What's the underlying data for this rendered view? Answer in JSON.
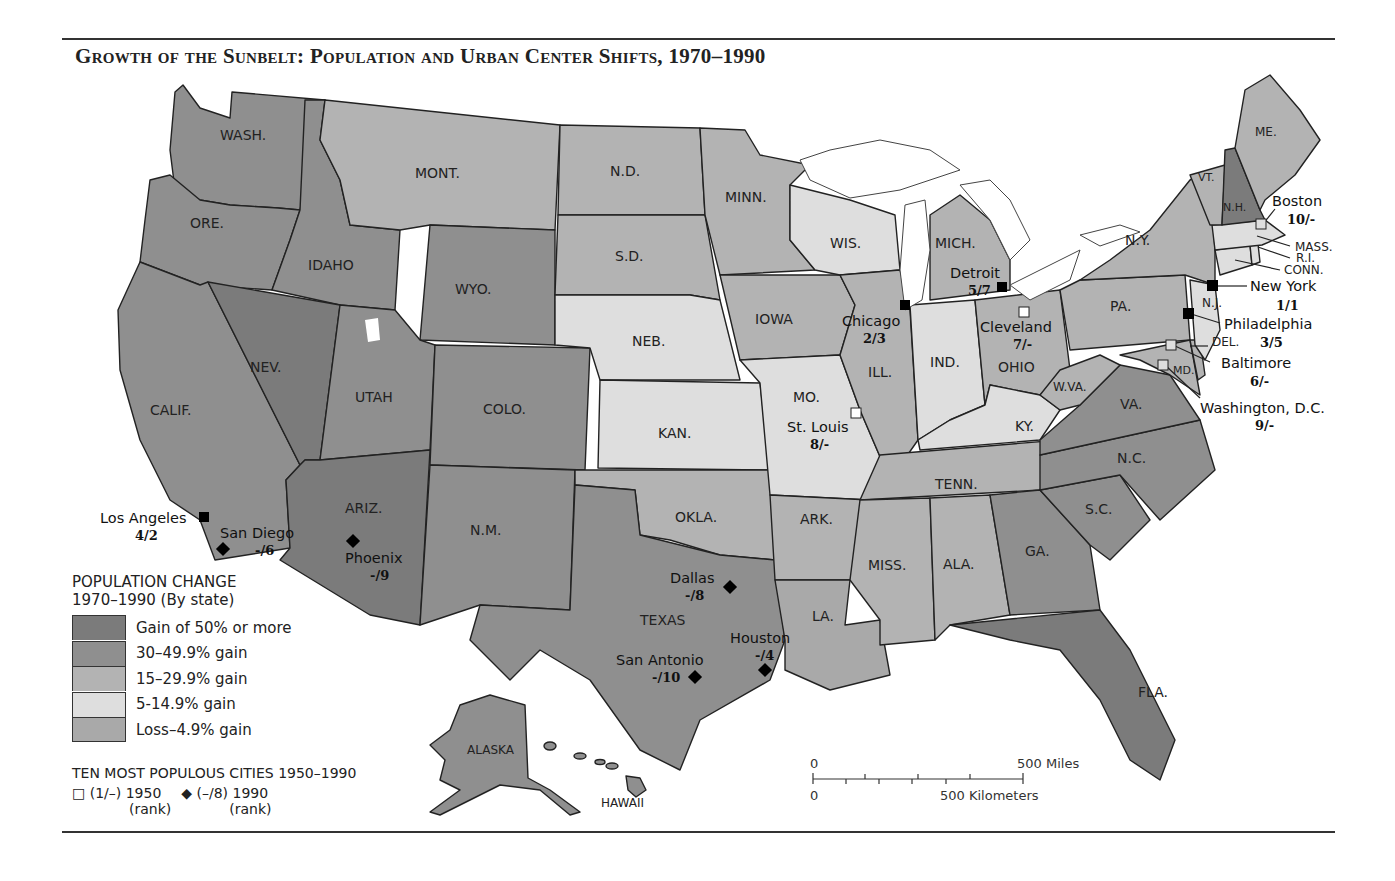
{
  "title": "Growth of the Sunbelt: Population and Urban Center Shifts, 1970–1990",
  "colors": {
    "gain50plus": "#7b7b7b",
    "gain30_49": "#8f8f8f",
    "gain15_29": "#b3b3b3",
    "gain5_14": "#dedede",
    "loss_4_9": "#a9a9a9",
    "border": "#222222",
    "lakes": "#ffffff"
  },
  "legend": {
    "heading_line1": "POPULATION CHANGE",
    "heading_line2": "1970–1990 (By state)",
    "items": [
      {
        "label": "Gain of 50% or more",
        "color": "#7b7b7b"
      },
      {
        "label": "30–49.9% gain",
        "color": "#8f8f8f"
      },
      {
        "label": "15–29.9% gain",
        "color": "#b3b3b3"
      },
      {
        "label": "5-14.9% gain",
        "color": "#dedede"
      },
      {
        "label": "Loss–4.9% gain",
        "color": "#a9a9a9"
      }
    ]
  },
  "cities_legend": {
    "heading": "TEN MOST POPULOUS CITIES 1950–1990",
    "open_square": "□",
    "label_1950": "(1/–) 1950",
    "diamond": "◆",
    "label_1990": "(–/8) 1990",
    "rank_note": "(rank)"
  },
  "scale": {
    "zero_miles": "0",
    "miles": "500 Miles",
    "zero_km": "0",
    "km": "500 Kilometers"
  },
  "states": {
    "wa": "WASH.",
    "or": "ORE.",
    "ca": "CALIF.",
    "id": "IDAHO",
    "nv": "NEV.",
    "mt": "MONT.",
    "wy": "WYO.",
    "ut": "UTAH",
    "co": "COLO.",
    "az": "ARIZ.",
    "nm": "N.M.",
    "nd": "N.D.",
    "sd": "S.D.",
    "ne": "NEB.",
    "ks": "KAN.",
    "ok": "OKLA.",
    "tx": "TEXAS",
    "mn": "MINN.",
    "ia": "IOWA",
    "mo": "MO.",
    "ar": "ARK.",
    "la": "LA.",
    "wi": "WIS.",
    "il": "ILL.",
    "mi": "MICH.",
    "in": "IND.",
    "oh": "OHIO",
    "ky": "KY.",
    "tn": "TENN.",
    "ms": "MISS.",
    "al": "ALA.",
    "ga": "GA.",
    "fl": "FLA.",
    "sc": "S.C.",
    "nc": "N.C.",
    "va": "VA.",
    "wv": "W.VA.",
    "pa": "PA.",
    "ny": "N.Y.",
    "vt": "VT.",
    "nh": "N.H.",
    "me": "ME.",
    "ma": "MASS.",
    "ri": "R.I.",
    "ct": "CONN.",
    "nj": "N.J.",
    "de": "DEL.",
    "md": "MD.",
    "ak": "ALASKA",
    "hi": "HAWAII"
  },
  "cities": [
    {
      "name": "Los Angeles",
      "rank": "4/2",
      "marker": "filled-square"
    },
    {
      "name": "San Diego",
      "rank": "-/6",
      "marker": "diamond"
    },
    {
      "name": "Phoenix",
      "rank": "-/9",
      "marker": "diamond"
    },
    {
      "name": "Dallas",
      "rank": "-/8",
      "marker": "diamond"
    },
    {
      "name": "Houston",
      "rank": "-/4",
      "marker": "diamond"
    },
    {
      "name": "San Antonio",
      "rank": "-/10",
      "marker": "diamond"
    },
    {
      "name": "St. Louis",
      "rank": "8/-",
      "marker": "open-square"
    },
    {
      "name": "Chicago",
      "rank": "2/3",
      "marker": "filled-square"
    },
    {
      "name": "Detroit",
      "rank": "5/7",
      "marker": "filled-square"
    },
    {
      "name": "Cleveland",
      "rank": "7/-",
      "marker": "open-square"
    },
    {
      "name": "Boston",
      "rank": "10/-",
      "marker": "open-square"
    },
    {
      "name": "New York",
      "rank": "1/1",
      "marker": "filled-square"
    },
    {
      "name": "Philadelphia",
      "rank": "3/5",
      "marker": "filled-square"
    },
    {
      "name": "Baltimore",
      "rank": "6/-",
      "marker": "open-square"
    },
    {
      "name": "Washington, D.C.",
      "rank": "9/-",
      "marker": "open-square"
    }
  ]
}
